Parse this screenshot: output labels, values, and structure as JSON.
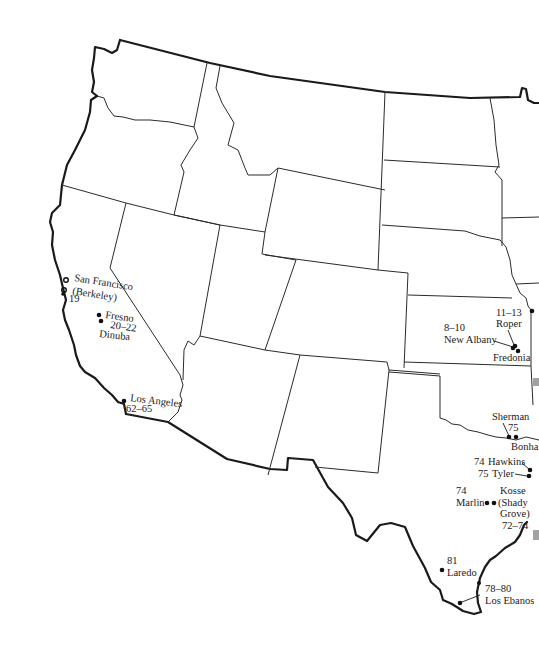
{
  "map": {
    "title": "Western United States – field locations",
    "colors": {
      "background": "#ffffff",
      "lines": "#1a1a1a"
    },
    "locations": [
      {
        "id": "san-francisco",
        "name": "San Francisco",
        "sub": "(Berkeley)",
        "pages": "19"
      },
      {
        "id": "fresno",
        "name": "Fresno",
        "pages": "20–22"
      },
      {
        "id": "dinuba",
        "name": "Dinuba"
      },
      {
        "id": "los-angeles",
        "name": "Los Angeles",
        "pages": "62–65"
      },
      {
        "id": "roper",
        "name": "Roper",
        "pages": "11–13"
      },
      {
        "id": "new-albany",
        "name": "New Albany",
        "pages": "8–10"
      },
      {
        "id": "fredonia",
        "name": "Fredonia"
      },
      {
        "id": "sherman",
        "name": "Sherman",
        "pages": "75"
      },
      {
        "id": "bonham",
        "name": "Bonha"
      },
      {
        "id": "hawkins",
        "name": "Hawkins",
        "pages": "74"
      },
      {
        "id": "tyler",
        "name": "Tyler",
        "pages": "75"
      },
      {
        "id": "marlin",
        "name": "Marlin",
        "pages": "74"
      },
      {
        "id": "kosse",
        "name": "Kosse",
        "sub1": "(Shady",
        "sub2": "Grove)",
        "pages": "72–74"
      },
      {
        "id": "laredo",
        "name": "Laredo",
        "pages": "81"
      },
      {
        "id": "los-ebanos",
        "name": "Los Ebanos",
        "pages": "78–80"
      }
    ]
  }
}
